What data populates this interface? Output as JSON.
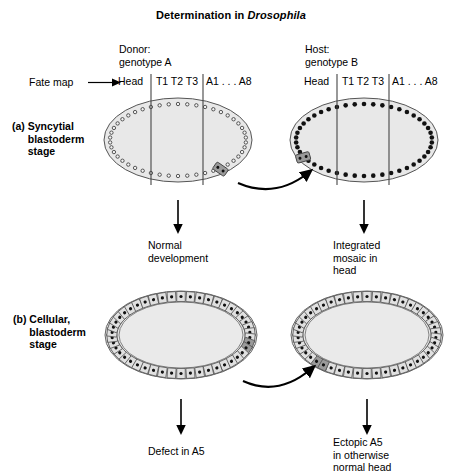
{
  "figure": {
    "title_prefix": "Determination in ",
    "title_species": "Drosophila",
    "background_color": "#ffffff",
    "line_color": "#000000",
    "embryo_fill": "#e8e8e8",
    "embryo_stroke": "#555555",
    "graft_fill": "#9a9a9a",
    "cell_fill": "#e0e0e0"
  },
  "columns": {
    "donor": "Donor:\ngenotype A",
    "host": "Host:\ngenotype B"
  },
  "fate_map": {
    "label": "Fate map",
    "arrow_icon": "right-arrow-icon",
    "segments": {
      "head": "Head",
      "thorax": "T1 T2 T3",
      "abdomen": "A1 . . .   A8"
    }
  },
  "panels": [
    {
      "id": "a",
      "tag": "(a)",
      "title": "Syncytial\nblastoderm\nstage",
      "donor_outcome": "Normal\ndevelopment",
      "host_outcome": "Integrated\nmosaic in\nhead",
      "donor_embryo": {
        "type": "syncytial",
        "nuclei_count": 46,
        "nuclei_style": "small-open-dots",
        "graft_position": "posterior-ventral",
        "graft_region": "A5"
      },
      "host_embryo": {
        "type": "syncytial",
        "nuclei_count": 46,
        "nuclei_style": "large-filled-dots",
        "graft_position": "anterior-ventral",
        "graft_region": "head"
      },
      "transfer_arrow": "curved-transfer-arrow"
    },
    {
      "id": "b",
      "tag": "(b)",
      "title": "Cellular,\nblastoderm\nstage",
      "donor_outcome": "Defect in A5",
      "host_outcome": "Ectopic A5\nin otherwise\nnormal head",
      "donor_embryo": {
        "type": "cellular",
        "cell_count": 46,
        "nuclei_style": "boxed-cells",
        "graft_position": "posterior-ventral",
        "graft_region": "A5"
      },
      "host_embryo": {
        "type": "cellular",
        "cell_count": 46,
        "nuclei_style": "boxed-cells",
        "graft_position": "anterior-ventral",
        "graft_region": "head"
      },
      "transfer_arrow": "curved-transfer-arrow"
    }
  ]
}
